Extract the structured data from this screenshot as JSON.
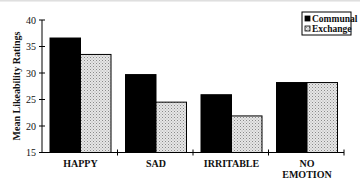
{
  "chart_data": {
    "type": "bar",
    "title": "",
    "xlabel": "",
    "ylabel": "Mean Likeability Ratings",
    "ylim": [
      15,
      40
    ],
    "yticks": [
      15,
      20,
      25,
      30,
      35,
      40
    ],
    "grid": false,
    "legend_position": "top-right",
    "categories": [
      "HAPPY",
      "SAD",
      "IRRITABLE",
      "NO EMOTION"
    ],
    "category_lines": [
      [
        "HAPPY"
      ],
      [
        "SAD"
      ],
      [
        "IRRITABLE"
      ],
      [
        "NO",
        "EMOTION"
      ]
    ],
    "series": [
      {
        "name": "Communal",
        "values": [
          36.6,
          29.7,
          25.9,
          28.2
        ],
        "fill": "#000000"
      },
      {
        "name": "Exchange",
        "values": [
          33.5,
          24.5,
          21.9,
          28.2
        ],
        "fill": "#d9d9d9"
      }
    ]
  },
  "legend": {
    "items": [
      {
        "label": "Communal"
      },
      {
        "label": "Exchange"
      }
    ]
  }
}
